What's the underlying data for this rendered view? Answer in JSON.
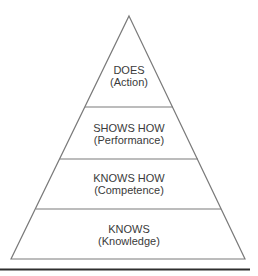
{
  "diagram": {
    "type": "pyramid",
    "colors": {
      "outline": "#7a7a7a",
      "text": "#3a3a3a",
      "bottom_rule": "#2e2e2e",
      "background": "#ffffff"
    },
    "tiers": [
      {
        "title": "DOES",
        "subtitle": "(Action)"
      },
      {
        "title": "SHOWS HOW",
        "subtitle": "(Performance)"
      },
      {
        "title": "KNOWS HOW",
        "subtitle": "(Competence)"
      },
      {
        "title": "KNOWS",
        "subtitle": "(Knowledge)"
      }
    ]
  }
}
